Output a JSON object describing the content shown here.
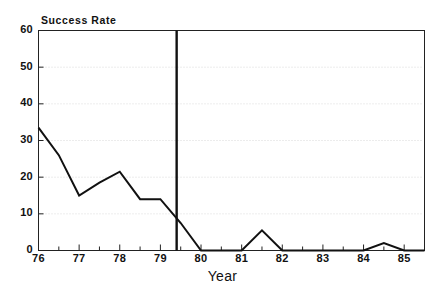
{
  "chart_data": {
    "type": "line",
    "title": "",
    "ylabel": "Success Rate",
    "xlabel": "Year",
    "ylim": [
      0,
      60
    ],
    "xlim": [
      76,
      85.5
    ],
    "grid": true,
    "legend": null,
    "ytick_labels": [
      "0",
      "10",
      "20",
      "30",
      "40",
      "50",
      "60"
    ],
    "ytick_values": [
      0,
      10,
      20,
      30,
      40,
      50,
      60
    ],
    "xtick_labels": [
      "76",
      "77",
      "78",
      "79",
      "80",
      "81",
      "82",
      "83",
      "84",
      "85"
    ],
    "xtick_values": [
      76,
      77,
      78,
      79,
      80,
      81,
      82,
      83,
      84,
      85
    ],
    "x": [
      76,
      76.5,
      77,
      77.5,
      78,
      78.5,
      79,
      79.5,
      80,
      80.5,
      81,
      81.5,
      82,
      82.5,
      83,
      83.5,
      84,
      84.5,
      85,
      85.5
    ],
    "values": [
      33.5,
      26,
      15,
      18.5,
      21.5,
      14,
      14,
      7.5,
      0,
      0,
      0,
      5.5,
      0,
      0,
      0,
      0,
      0,
      2,
      0,
      0
    ],
    "series": [
      {
        "name": "Success Rate",
        "values": [
          33.5,
          26,
          15,
          18.5,
          21.5,
          14,
          14,
          7.5,
          0,
          0,
          0,
          5.5,
          0,
          0,
          0,
          0,
          0,
          2,
          0,
          0
        ]
      }
    ],
    "annotations": [
      {
        "type": "vertical-line",
        "x": 79.4,
        "label": ""
      }
    ]
  },
  "axis": {
    "y_title": "Success Rate",
    "x_title": "Year"
  }
}
